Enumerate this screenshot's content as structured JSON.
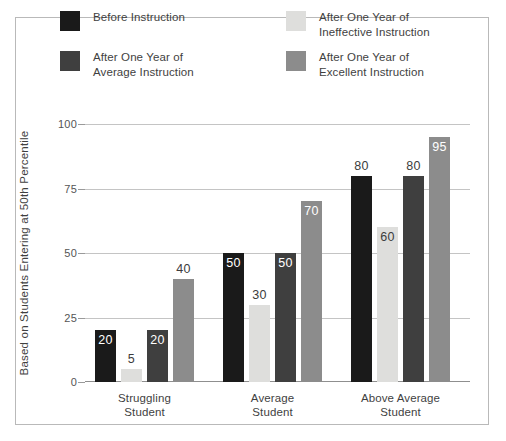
{
  "chart_data": {
    "type": "bar",
    "title": "",
    "subtitle": "",
    "xlabel": "",
    "ylabel": "Based on Students Entering at 50th Percentile",
    "ylim": [
      0,
      100
    ],
    "yticks": [
      0,
      25,
      50,
      75,
      100
    ],
    "grid": true,
    "legend_position": "top",
    "categories": [
      "Struggling\nStudent",
      "Average\nStudent",
      "Above Average\nStudent"
    ],
    "series": [
      {
        "name": "Before Instruction",
        "legend_label": "Before Instruction",
        "color": "#1a1a1a",
        "values": [
          20,
          50,
          80
        ],
        "label_placement": [
          "inside",
          "inside",
          "outside"
        ]
      },
      {
        "name": "After One Year of Ineffective Instruction",
        "legend_label": "After One Year of\nIneffective Instruction",
        "color": "#dededc",
        "values": [
          5,
          30,
          60
        ],
        "label_placement": [
          "outside",
          "outside",
          "inside"
        ]
      },
      {
        "name": "After One Year of Average Instruction",
        "legend_label": "After One Year of\nAverage Instruction",
        "color": "#3f3f3f",
        "values": [
          20,
          50,
          80
        ],
        "label_placement": [
          "inside",
          "inside",
          "outside"
        ]
      },
      {
        "name": "After One Year of Excellent Instruction",
        "legend_label": "After One Year of\nExcellent Instruction",
        "color": "#8c8c8c",
        "values": [
          40,
          70,
          95
        ],
        "label_placement": [
          "outside",
          "inside",
          "inside"
        ]
      }
    ]
  },
  "axis": {
    "ytick_labels": [
      "0",
      "25",
      "50",
      "75",
      "100"
    ],
    "y_title": "Based on Students Entering at 50th Percentile"
  },
  "legend": {
    "items": [
      {
        "label": "Before Instruction",
        "color": "#1a1a1a"
      },
      {
        "label": "After One Year of\nAverage Instruction",
        "color": "#3f3f3f"
      },
      {
        "label": "After One Year of\nIneffective Instruction",
        "color": "#dededc"
      },
      {
        "label": "After One Year of\nExcellent Instruction",
        "color": "#8c8c8c"
      }
    ]
  },
  "categories": [
    {
      "label": "Struggling\nStudent"
    },
    {
      "label": "Average\nStudent"
    },
    {
      "label": "Above Average\nStudent"
    }
  ],
  "bar_labels": {
    "g0": [
      "20",
      "5",
      "20",
      "40"
    ],
    "g1": [
      "50",
      "30",
      "50",
      "70"
    ],
    "g2": [
      "80",
      "60",
      "80",
      "95"
    ]
  }
}
